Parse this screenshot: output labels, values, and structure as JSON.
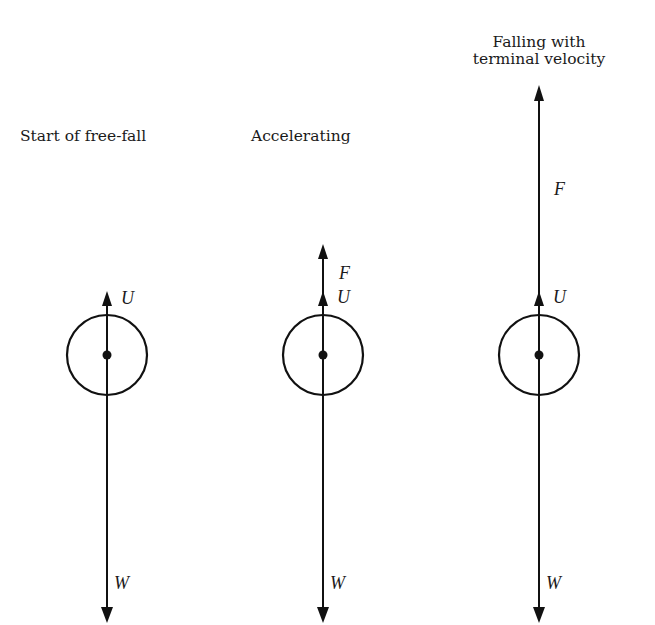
{
  "diagram": {
    "type": "free-body diagrams",
    "colors": {
      "ink": "#111111",
      "background": "#ffffff"
    },
    "panels": [
      {
        "id": "start",
        "caption_lines": [
          "Start of free-fall"
        ],
        "center_x": 107,
        "body_center_y": 355,
        "body_radius": 40,
        "forces": [
          {
            "name": "U",
            "label": "U",
            "direction": "up",
            "tip_y": 292
          },
          {
            "name": "W",
            "label": "W",
            "direction": "down",
            "tip_y": 622
          }
        ]
      },
      {
        "id": "accelerating",
        "caption_lines": [
          "Accelerating"
        ],
        "center_x": 323,
        "body_center_y": 355,
        "body_radius": 40,
        "forces": [
          {
            "name": "U",
            "label": "U",
            "direction": "up",
            "tip_y": 292
          },
          {
            "name": "F",
            "label": "F",
            "direction": "up",
            "tip_y": 244
          },
          {
            "name": "W",
            "label": "W",
            "direction": "down",
            "tip_y": 622
          }
        ]
      },
      {
        "id": "terminal",
        "caption_lines": [
          "Falling with",
          "terminal velocity"
        ],
        "center_x": 539,
        "body_center_y": 355,
        "body_radius": 40,
        "forces": [
          {
            "name": "U",
            "label": "U",
            "direction": "up",
            "tip_y": 292
          },
          {
            "name": "F",
            "label": "F",
            "direction": "up",
            "tip_y": 86
          },
          {
            "name": "W",
            "label": "W",
            "direction": "down",
            "tip_y": 622
          }
        ]
      }
    ],
    "text": {
      "caption_start": "Start of free-fall",
      "caption_accelerating": "Accelerating",
      "caption_terminal_line1": "Falling with",
      "caption_terminal_line2": "terminal velocity",
      "label_U": "U",
      "label_F": "F",
      "label_W": "W"
    }
  }
}
